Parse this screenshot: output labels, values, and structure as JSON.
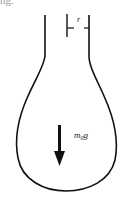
{
  "caption_fragment": "ng.",
  "figure": {
    "type": "flask-diagram",
    "radius_label": "r",
    "force_label": "m",
    "force_subscript": "0",
    "force_suffix": "g",
    "stroke_color": "#111111",
    "arrow_direction": "down"
  }
}
